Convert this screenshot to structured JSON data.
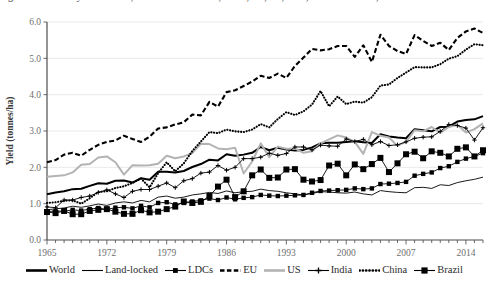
{
  "figure": {
    "title_clipped": "Figure 1.2.4 Wheat yield in world, land-locked countries, LDCs, EU, US, India, China and Brazil, 1965-2016"
  },
  "chart_data": {
    "type": "line",
    "title": "",
    "xlabel": "",
    "ylabel": "Yield (tonnes/ha)",
    "xlim": [
      1965,
      2016
    ],
    "ylim": [
      0.0,
      6.0
    ],
    "yticks": [
      "0.0",
      "1.0",
      "2.0",
      "3.0",
      "4.0",
      "5.0",
      "6.0"
    ],
    "xticks": [
      "1965",
      "1972",
      "1979",
      "1986",
      "1993",
      "2000",
      "2007",
      "2014"
    ],
    "xtick_values": [
      1965,
      1972,
      1979,
      1986,
      1993,
      2000,
      2007,
      2014
    ],
    "grid": "horizontal",
    "legend_position": "bottom",
    "x": [
      1965,
      1966,
      1967,
      1968,
      1969,
      1970,
      1971,
      1972,
      1973,
      1974,
      1975,
      1976,
      1977,
      1978,
      1979,
      1980,
      1981,
      1982,
      1983,
      1984,
      1985,
      1986,
      1987,
      1988,
      1989,
      1990,
      1991,
      1992,
      1993,
      1994,
      1995,
      1996,
      1997,
      1998,
      1999,
      2000,
      2001,
      2002,
      2003,
      2004,
      2005,
      2006,
      2007,
      2008,
      2009,
      2010,
      2011,
      2012,
      2013,
      2014,
      2015,
      2016
    ],
    "series": [
      {
        "name": "World",
        "style": "solid-thick-black",
        "color": "#000000",
        "values": [
          1.26,
          1.31,
          1.34,
          1.4,
          1.41,
          1.49,
          1.56,
          1.55,
          1.63,
          1.64,
          1.58,
          1.7,
          1.66,
          1.88,
          1.88,
          1.86,
          1.9,
          2.01,
          2.09,
          2.21,
          2.19,
          2.36,
          2.32,
          2.35,
          2.4,
          2.56,
          2.47,
          2.54,
          2.49,
          2.46,
          2.48,
          2.55,
          2.66,
          2.68,
          2.68,
          2.7,
          2.72,
          2.69,
          2.67,
          2.91,
          2.85,
          2.82,
          2.8,
          3.05,
          3.02,
          2.99,
          3.11,
          3.12,
          3.26,
          3.3,
          3.32,
          3.41
        ]
      },
      {
        "name": "Land-locked",
        "style": "solid-thin-black",
        "color": "#000000",
        "values": [
          0.83,
          0.86,
          0.88,
          0.93,
          0.9,
          0.94,
          0.99,
          0.95,
          1.02,
          1.05,
          1.02,
          1.09,
          1.05,
          1.18,
          1.21,
          1.15,
          1.18,
          1.24,
          1.27,
          1.31,
          1.28,
          1.35,
          1.3,
          1.33,
          1.34,
          1.4,
          1.36,
          1.34,
          1.3,
          1.27,
          1.24,
          1.28,
          1.33,
          1.32,
          1.3,
          1.29,
          1.32,
          1.27,
          1.24,
          1.36,
          1.33,
          1.31,
          1.3,
          1.44,
          1.45,
          1.42,
          1.52,
          1.5,
          1.58,
          1.63,
          1.67,
          1.73
        ]
      },
      {
        "name": "LDCs",
        "style": "solid-thin-black-square-marker",
        "color": "#000000",
        "values": [
          0.78,
          0.8,
          0.79,
          0.83,
          0.81,
          0.85,
          0.88,
          0.84,
          0.89,
          0.9,
          0.87,
          0.94,
          0.9,
          1.02,
          1.04,
          0.98,
          1.02,
          1.06,
          1.09,
          1.14,
          1.1,
          1.17,
          1.12,
          1.16,
          1.18,
          1.24,
          1.22,
          1.21,
          1.22,
          1.23,
          1.24,
          1.3,
          1.35,
          1.36,
          1.37,
          1.38,
          1.42,
          1.4,
          1.42,
          1.54,
          1.55,
          1.57,
          1.6,
          1.77,
          1.82,
          1.86,
          1.98,
          2.03,
          2.15,
          2.24,
          2.3,
          2.39
        ]
      },
      {
        "name": "EU",
        "style": "dashed-thick-black",
        "color": "#000000",
        "values": [
          2.14,
          2.2,
          2.35,
          2.4,
          2.32,
          2.48,
          2.62,
          2.7,
          2.74,
          2.87,
          2.78,
          2.7,
          2.84,
          3.07,
          3.1,
          3.18,
          3.24,
          3.45,
          3.43,
          3.8,
          3.67,
          4.07,
          4.12,
          4.24,
          4.36,
          4.52,
          4.46,
          4.58,
          4.46,
          4.79,
          5.02,
          5.26,
          5.22,
          5.25,
          5.34,
          5.34,
          5.04,
          5.36,
          4.9,
          5.65,
          5.34,
          5.2,
          5.12,
          5.64,
          5.48,
          5.34,
          5.43,
          5.23,
          5.56,
          5.74,
          5.82,
          5.7
        ]
      },
      {
        "name": "US",
        "style": "solid-thick-gray",
        "color": "#b3b3b3",
        "values": [
          1.74,
          1.76,
          1.78,
          1.86,
          2.07,
          2.09,
          2.27,
          2.3,
          2.14,
          1.8,
          2.06,
          2.05,
          2.06,
          2.1,
          2.32,
          2.25,
          2.3,
          2.39,
          2.65,
          2.64,
          2.52,
          2.5,
          2.54,
          1.83,
          2.16,
          2.66,
          2.28,
          2.57,
          2.51,
          2.52,
          2.4,
          2.44,
          2.66,
          2.77,
          2.88,
          2.82,
          2.7,
          2.37,
          2.97,
          2.87,
          2.82,
          2.59,
          2.71,
          3.02,
          2.99,
          3.11,
          2.95,
          3.11,
          3.17,
          2.96,
          3.05,
          3.21
        ]
      },
      {
        "name": "India",
        "style": "solid-thin-black-plus-marker",
        "color": "#000000",
        "values": [
          0.91,
          0.89,
          1.1,
          1.1,
          1.17,
          1.21,
          1.31,
          1.38,
          1.27,
          1.17,
          1.34,
          1.39,
          1.39,
          1.48,
          1.57,
          1.44,
          1.63,
          1.69,
          1.84,
          1.87,
          2.05,
          1.92,
          2.0,
          2.24,
          2.24,
          2.28,
          2.39,
          2.33,
          2.38,
          2.56,
          2.56,
          2.48,
          2.61,
          2.59,
          2.58,
          2.78,
          2.71,
          2.77,
          2.62,
          2.71,
          2.6,
          2.62,
          2.7,
          2.8,
          2.83,
          2.84,
          2.99,
          3.18,
          3.15,
          3.08,
          2.75,
          3.09
        ]
      },
      {
        "name": "China",
        "style": "dotted-thick-black",
        "color": "#000000",
        "values": [
          1.02,
          1.04,
          1.08,
          1.09,
          1.0,
          1.15,
          1.32,
          1.34,
          1.43,
          1.48,
          1.57,
          1.69,
          1.45,
          1.84,
          2.14,
          1.89,
          2.11,
          2.45,
          2.71,
          2.97,
          2.94,
          3.04,
          2.99,
          2.97,
          3.04,
          3.19,
          3.1,
          3.33,
          3.52,
          3.44,
          3.54,
          3.73,
          4.1,
          3.68,
          3.95,
          3.74,
          3.81,
          3.78,
          3.93,
          4.25,
          4.28,
          4.46,
          4.61,
          4.76,
          4.75,
          4.75,
          4.84,
          4.99,
          5.06,
          5.24,
          5.39,
          5.36
        ]
      },
      {
        "name": "Brazil",
        "style": "solid-thin-black-bigsquare-marker",
        "color": "#000000",
        "values": [
          0.77,
          0.74,
          0.8,
          0.71,
          0.71,
          0.8,
          0.83,
          0.85,
          0.78,
          0.72,
          0.72,
          0.82,
          0.76,
          0.78,
          0.85,
          0.92,
          1.06,
          1.02,
          1.05,
          1.21,
          1.47,
          1.66,
          1.18,
          1.34,
          1.78,
          1.94,
          1.71,
          1.72,
          1.94,
          1.95,
          1.66,
          1.61,
          1.65,
          2.05,
          2.1,
          1.78,
          2.08,
          1.95,
          2.09,
          2.26,
          1.87,
          2.11,
          2.36,
          2.43,
          2.25,
          2.44,
          2.4,
          2.3,
          2.51,
          2.55,
          2.3,
          2.47
        ]
      }
    ]
  },
  "legend": {
    "items": [
      {
        "label": "World",
        "swatch": "thick-solid-black-line"
      },
      {
        "label": "Land-locked",
        "swatch": "thin-solid-black-line"
      },
      {
        "label": "LDCs",
        "swatch": "line-with-square-marker"
      },
      {
        "label": "EU",
        "swatch": "thick-dashed-black-line"
      },
      {
        "label": "US",
        "swatch": "thick-solid-gray-line"
      },
      {
        "label": "India",
        "swatch": "line-with-plus-marker"
      },
      {
        "label": "China",
        "swatch": "thick-dotted-black-line"
      },
      {
        "label": "Brazil",
        "swatch": "line-with-big-square-marker"
      }
    ]
  }
}
